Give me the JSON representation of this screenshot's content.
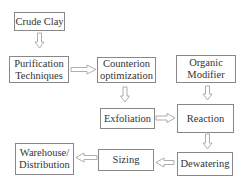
{
  "diagram": {
    "nodes": [
      {
        "id": "crude_clay",
        "label": "Crude Clay"
      },
      {
        "id": "purification",
        "label": "Purification Techniques"
      },
      {
        "id": "counterion",
        "label": "Counterion optimization"
      },
      {
        "id": "organic_modifier",
        "label": "Organic Modifier"
      },
      {
        "id": "exfoliation",
        "label": "Exfoliation"
      },
      {
        "id": "reaction",
        "label": "Reaction"
      },
      {
        "id": "dewatering",
        "label": "Dewatering"
      },
      {
        "id": "sizing",
        "label": "Sizing"
      },
      {
        "id": "warehouse",
        "label": "Warehouse/ Distribution"
      }
    ],
    "edges": [
      {
        "from": "crude_clay",
        "to": "purification"
      },
      {
        "from": "purification",
        "to": "counterion"
      },
      {
        "from": "counterion",
        "to": "exfoliation"
      },
      {
        "from": "organic_modifier",
        "to": "reaction"
      },
      {
        "from": "exfoliation",
        "to": "reaction"
      },
      {
        "from": "reaction",
        "to": "dewatering"
      },
      {
        "from": "dewatering",
        "to": "sizing"
      },
      {
        "from": "sizing",
        "to": "warehouse"
      }
    ]
  }
}
